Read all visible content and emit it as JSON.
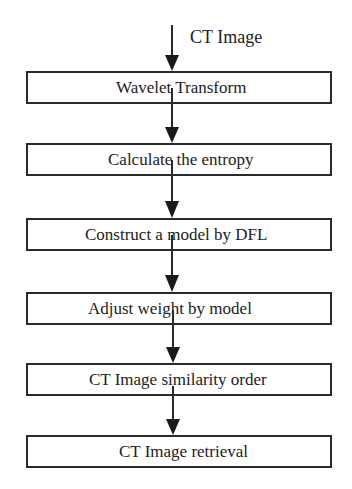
{
  "diagram": {
    "input_label": "CT Image",
    "steps": [
      {
        "label": "Wavelet Transform"
      },
      {
        "label": "Calculate the entropy"
      },
      {
        "label": "Construct a model by DFL"
      },
      {
        "label": "Adjust weight by model"
      },
      {
        "label": "CT Image similarity order"
      },
      {
        "label": "CT Image retrieval"
      }
    ],
    "colors": {
      "line": "#2a2a2a",
      "text": "#222222",
      "background": "#ffffff"
    }
  }
}
